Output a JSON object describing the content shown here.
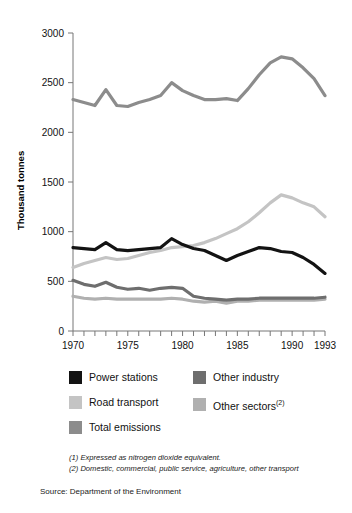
{
  "chart_data": {
    "type": "line",
    "title": "",
    "xlabel": "",
    "ylabel": "Thousand tonnes",
    "xlim": [
      1970,
      1993
    ],
    "ylim": [
      0,
      3000
    ],
    "yticks": [
      0,
      500,
      1000,
      1500,
      2000,
      2500,
      3000
    ],
    "xticks": [
      1970,
      1971,
      1972,
      1973,
      1974,
      1975,
      1976,
      1977,
      1978,
      1979,
      1980,
      1981,
      1982,
      1983,
      1984,
      1985,
      1986,
      1987,
      1988,
      1989,
      1990,
      1991,
      1992,
      1993
    ],
    "xtick_labels_shown": [
      "1970",
      "1975",
      "1980",
      "1985",
      "1990",
      "1993"
    ],
    "grid": false,
    "legend_position": "below-plot",
    "x": [
      1970,
      1971,
      1972,
      1973,
      1974,
      1975,
      1976,
      1977,
      1978,
      1979,
      1980,
      1981,
      1982,
      1983,
      1984,
      1985,
      1986,
      1987,
      1988,
      1989,
      1990,
      1991,
      1992,
      1993
    ],
    "series": [
      {
        "name": "Total emissions",
        "color": "#8c8c8c",
        "values": [
          2330,
          2300,
          2270,
          2430,
          2270,
          2260,
          2300,
          2330,
          2370,
          2500,
          2420,
          2370,
          2330,
          2330,
          2340,
          2320,
          2440,
          2580,
          2700,
          2760,
          2740,
          2650,
          2540,
          2370
        ]
      },
      {
        "name": "Road transport",
        "color": "#c4c4c4",
        "values": [
          640,
          680,
          710,
          740,
          720,
          730,
          760,
          790,
          810,
          840,
          850,
          860,
          890,
          930,
          980,
          1030,
          1100,
          1190,
          1290,
          1370,
          1340,
          1290,
          1250,
          1150
        ]
      },
      {
        "name": "Power stations",
        "color": "#131313",
        "values": [
          840,
          830,
          820,
          890,
          820,
          810,
          820,
          830,
          840,
          930,
          870,
          830,
          810,
          760,
          710,
          760,
          800,
          840,
          830,
          800,
          790,
          740,
          670,
          580
        ]
      },
      {
        "name": "Other industry",
        "color": "#6e6e6e",
        "values": [
          510,
          470,
          450,
          490,
          440,
          420,
          430,
          410,
          430,
          440,
          430,
          350,
          330,
          320,
          310,
          320,
          320,
          330,
          330,
          330,
          330,
          330,
          330,
          340
        ]
      },
      {
        "name": "Other sectors",
        "color": "#b0b0b0",
        "values": [
          350,
          330,
          320,
          330,
          320,
          320,
          320,
          320,
          320,
          330,
          320,
          300,
          290,
          300,
          280,
          300,
          300,
          310,
          310,
          310,
          310,
          310,
          310,
          320
        ]
      }
    ]
  },
  "axis": {
    "ylabel": "Thousand tonnes",
    "ytick_labels": [
      "3000",
      "2500",
      "2000",
      "1500",
      "1000",
      "500",
      "0"
    ],
    "xtick_labels": [
      "1970",
      "1975",
      "1980",
      "1985",
      "1990",
      "1993"
    ]
  },
  "legend": {
    "items": [
      {
        "label": "Power stations",
        "color": "#131313"
      },
      {
        "label": "Other industry",
        "color": "#6e6e6e"
      },
      {
        "label": "Road transport",
        "color": "#c4c4c4"
      },
      {
        "label": "Other sectors",
        "label_sup": "(2)",
        "color": "#b0b0b0"
      },
      {
        "label": "Total emissions",
        "color": "#8c8c8c"
      }
    ]
  },
  "footnotes": [
    "(1) Expressed as nitrogen dioxide equivalent.",
    "(2) Domestic, commercial, public service, agriculture, other transport"
  ],
  "source": "Source: Department of the Environment"
}
